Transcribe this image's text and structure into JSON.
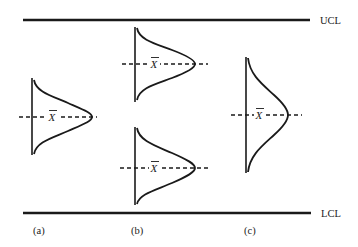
{
  "figure": {
    "limits": {
      "upper": {
        "label": "UCL"
      },
      "lower": {
        "label": "LCL"
      }
    },
    "mean_symbol": "X",
    "panels": [
      {
        "id": "a",
        "label": "(a)"
      },
      {
        "id": "b",
        "label": "(b)"
      },
      {
        "id": "c",
        "label": "(c)"
      }
    ],
    "colors": {
      "ink": "#1a1a1a",
      "background": "#ffffff"
    }
  }
}
